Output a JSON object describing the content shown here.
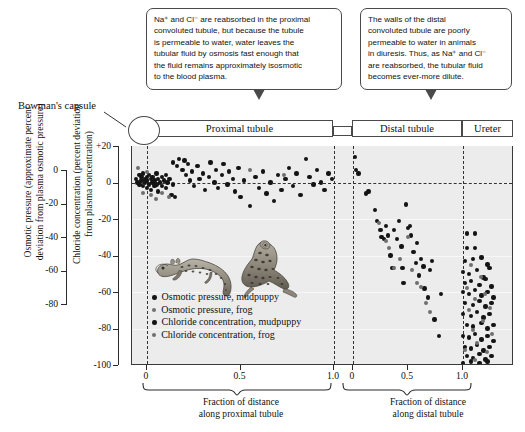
{
  "callouts": {
    "proximal": {
      "name": "proximal-tubule-callout",
      "lines": [
        "Na⁺ and Cl⁻ are reabsorbed in the proximal",
        "convoluted tubule, but because the tubule",
        "is permeable to water, water leaves the",
        "tubular fluid by osmosis fast enough that",
        "the fluid remains approximately isosmotic",
        "to the blood plasma."
      ]
    },
    "distal": {
      "name": "distal-tubule-callout",
      "lines": [
        "The walls of the distal",
        "convoluted tubule are poorly",
        "permeable to water in animals",
        "in diuresis.  Thus, as Na⁺ and Cl⁻",
        "are reabsorbed, the tubular fluid",
        "becomes ever-more dilute."
      ]
    }
  },
  "annotations": {
    "bowman": "Bowman's capsule"
  },
  "segments": {
    "proximal": "Proximal tubule",
    "henle": "",
    "distal": "Distal tubule",
    "ureter": "Ureter"
  },
  "legend": [
    {
      "label": "Osmotic pressure, mudpuppy",
      "marker": "dark"
    },
    {
      "label": "Osmotic pressure, frog",
      "marker": "mid"
    },
    {
      "label": "Chloride concentration, mudpuppy",
      "marker": "dark"
    },
    {
      "label": "Chloride concentration, frog",
      "marker": "mid"
    }
  ],
  "colors": {
    "plot_background": "#ececec",
    "marker_dark": "#141414",
    "marker_mid": "#6f6f6f",
    "axis": "#2b2b2b",
    "box_border": "#4a4a4a"
  },
  "chart_data": {
    "type": "scatter",
    "title": "",
    "ylabel_left": "Osmotic pressure (approximate percent deviation from plasma osmotic pressure)",
    "ylabel_right": "Chloride concentration (percent deviation from plasma concentration)",
    "ylim": [
      -100,
      20
    ],
    "yticks": [
      "+20",
      "0",
      "-20",
      "-40",
      "-60",
      "-80",
      "-100"
    ],
    "ytick_values": [
      20,
      0,
      -20,
      -40,
      -60,
      -80,
      -100
    ],
    "yticks_osmotic": [
      "0",
      "-20",
      "-40",
      "-60",
      "-80"
    ],
    "ytick_values_osmotic": [
      0,
      -20,
      -40,
      -60,
      -80
    ],
    "grid": true,
    "zero_reference_line": 0,
    "panels": [
      {
        "name": "proximal tubule",
        "xlabel": "Fraction of distance along proximal tubule",
        "xticks": [
          "0",
          "0.5",
          "1.0"
        ],
        "xtick_values": [
          0,
          0.5,
          1.0
        ],
        "xlim": [
          0,
          1.0
        ]
      },
      {
        "name": "distal tubule",
        "xlabel": "Fraction of distance along distal tubule",
        "xticks": [
          "0",
          "0.5",
          "1.0"
        ],
        "xtick_values": [
          0,
          0.5,
          1.0
        ],
        "xlim": [
          0,
          1.0
        ]
      },
      {
        "name": "ureter",
        "xlabel": "",
        "xticks": [],
        "xtick_values": [],
        "xlim": [
          1.0,
          1.25
        ]
      }
    ],
    "series": [
      {
        "name": "Osmotic pressure, mudpuppy",
        "marker": "dark",
        "panel": "proximal",
        "points": [
          [
            -0.06,
            2
          ],
          [
            -0.05,
            0
          ],
          [
            -0.04,
            4
          ],
          [
            -0.04,
            -1
          ],
          [
            -0.03,
            3
          ],
          [
            -0.03,
            1
          ],
          [
            -0.02,
            5
          ],
          [
            -0.02,
            -2
          ],
          [
            -0.01,
            2
          ],
          [
            -0.01,
            0
          ],
          [
            0.0,
            3
          ],
          [
            0.0,
            -3
          ],
          [
            0.0,
            1
          ],
          [
            0.01,
            4
          ],
          [
            0.01,
            -1
          ],
          [
            0.02,
            2
          ],
          [
            0.02,
            -4
          ],
          [
            0.03,
            0
          ],
          [
            0.03,
            3
          ],
          [
            0.04,
            -2
          ],
          [
            0.04,
            1
          ],
          [
            0.05,
            5
          ],
          [
            0.05,
            -1
          ],
          [
            0.06,
            2
          ],
          [
            0.06,
            -5
          ],
          [
            0.07,
            0
          ],
          [
            0.08,
            3
          ],
          [
            0.08,
            -2
          ],
          [
            0.09,
            1
          ],
          [
            0.1,
            -3
          ],
          [
            0.1,
            4
          ],
          [
            0.11,
            0
          ],
          [
            0.12,
            2
          ],
          [
            0.13,
            -7
          ],
          [
            0.14,
            -1
          ],
          [
            0.15,
            -8
          ]
        ]
      },
      {
        "name": "Osmotic pressure, frog",
        "marker": "mid",
        "panel": "proximal",
        "points": [
          [
            -0.05,
            8
          ],
          [
            -0.02,
            -6
          ],
          [
            0.0,
            6
          ],
          [
            0.02,
            -7
          ],
          [
            0.05,
            -9
          ],
          [
            0.08,
            -6
          ],
          [
            0.12,
            -8
          ],
          [
            0.55,
            7
          ],
          [
            0.73,
            4
          ]
        ]
      },
      {
        "name": "Chloride concentration, mudpuppy",
        "marker": "dark",
        "panel": "proximal",
        "points": [
          [
            0.14,
            11
          ],
          [
            0.16,
            9
          ],
          [
            0.17,
            13
          ],
          [
            0.19,
            7
          ],
          [
            0.2,
            12
          ],
          [
            0.21,
            4
          ],
          [
            0.22,
            10
          ],
          [
            0.23,
            1
          ],
          [
            0.24,
            6
          ],
          [
            0.25,
            -2
          ],
          [
            0.27,
            9
          ],
          [
            0.28,
            2
          ],
          [
            0.3,
            5
          ],
          [
            0.31,
            -4
          ],
          [
            0.33,
            3
          ],
          [
            0.34,
            11
          ],
          [
            0.36,
            0
          ],
          [
            0.37,
            7
          ],
          [
            0.38,
            -3
          ],
          [
            0.4,
            4
          ],
          [
            0.41,
            10
          ],
          [
            0.43,
            -1
          ],
          [
            0.44,
            6
          ],
          [
            0.46,
            2
          ],
          [
            0.47,
            -5
          ],
          [
            0.49,
            8
          ],
          [
            0.5,
            -8
          ],
          [
            0.52,
            1
          ],
          [
            0.55,
            -13
          ],
          [
            0.58,
            3
          ],
          [
            0.6,
            -3
          ],
          [
            0.62,
            6
          ],
          [
            0.64,
            -6
          ],
          [
            0.66,
            0
          ],
          [
            0.68,
            -10
          ],
          [
            0.7,
            4
          ],
          [
            0.72,
            -4
          ],
          [
            0.74,
            2
          ],
          [
            0.76,
            8
          ],
          [
            0.78,
            -2
          ],
          [
            0.8,
            5
          ],
          [
            0.82,
            -7
          ],
          [
            0.85,
            13
          ],
          [
            0.87,
            3
          ],
          [
            0.89,
            -1
          ],
          [
            0.91,
            7
          ],
          [
            0.93,
            0
          ],
          [
            0.95,
            -4
          ],
          [
            0.97,
            5
          ],
          [
            0.99,
            2
          ]
        ]
      },
      {
        "name": "Chloride concentration, mudpuppy",
        "marker": "dark",
        "panel": "distal",
        "points": [
          [
            0.02,
            14
          ],
          [
            0.03,
            7
          ],
          [
            0.05,
            5
          ],
          [
            0.12,
            -6
          ],
          [
            0.14,
            -5
          ],
          [
            0.2,
            -15
          ],
          [
            0.22,
            -21
          ],
          [
            0.25,
            -26
          ],
          [
            0.26,
            -30
          ],
          [
            0.28,
            -31
          ],
          [
            0.3,
            -24
          ],
          [
            0.32,
            -29
          ],
          [
            0.34,
            -40
          ],
          [
            0.36,
            -47
          ],
          [
            0.37,
            -26
          ],
          [
            0.4,
            -31
          ],
          [
            0.42,
            -21
          ],
          [
            0.44,
            -35
          ],
          [
            0.45,
            -47
          ],
          [
            0.46,
            -55
          ],
          [
            0.48,
            -12
          ],
          [
            0.5,
            -25
          ],
          [
            0.52,
            -24
          ],
          [
            0.53,
            -29
          ],
          [
            0.55,
            -38
          ],
          [
            0.57,
            -44
          ],
          [
            0.58,
            -33
          ],
          [
            0.6,
            -51
          ],
          [
            0.62,
            -42
          ],
          [
            0.64,
            -46
          ],
          [
            0.65,
            -58
          ],
          [
            0.68,
            -63
          ],
          [
            0.7,
            -48
          ],
          [
            0.72,
            -43
          ],
          [
            0.74,
            -75
          ],
          [
            0.78,
            -84
          ],
          [
            0.8,
            -61
          ]
        ]
      },
      {
        "name": "Chloride concentration, frog",
        "marker": "mid",
        "panel": "distal",
        "points": [
          [
            0.24,
            -22
          ],
          [
            0.3,
            -32
          ],
          [
            0.33,
            -36
          ],
          [
            0.37,
            -47
          ],
          [
            0.43,
            -42
          ],
          [
            0.5,
            -30
          ],
          [
            0.54,
            -48
          ],
          [
            0.58,
            -55
          ],
          [
            0.62,
            -57
          ],
          [
            0.66,
            -66
          ],
          [
            0.7,
            -71
          ]
        ]
      },
      {
        "name": "Chloride concentration, mudpuppy",
        "marker": "dark",
        "panel": "ureter",
        "points": [
          [
            1.02,
            -28
          ],
          [
            1.06,
            -28
          ],
          [
            1.02,
            -36
          ],
          [
            1.06,
            -36
          ],
          [
            1.01,
            -43
          ],
          [
            1.05,
            -42
          ],
          [
            1.09,
            -41
          ],
          [
            1.12,
            -45
          ],
          [
            1.0,
            -49
          ],
          [
            1.03,
            -50
          ],
          [
            1.07,
            -48
          ],
          [
            1.1,
            -52
          ],
          [
            1.13,
            -47
          ],
          [
            1.01,
            -55
          ],
          [
            1.04,
            -54
          ],
          [
            1.08,
            -56
          ],
          [
            1.11,
            -53
          ],
          [
            1.14,
            -57
          ],
          [
            1.0,
            -60
          ],
          [
            1.03,
            -61
          ],
          [
            1.06,
            -59
          ],
          [
            1.09,
            -62
          ],
          [
            1.12,
            -60
          ],
          [
            1.15,
            -63
          ],
          [
            1.01,
            -66
          ],
          [
            1.05,
            -67
          ],
          [
            1.08,
            -65
          ],
          [
            1.11,
            -68
          ],
          [
            1.14,
            -66
          ],
          [
            1.0,
            -72
          ],
          [
            1.04,
            -73
          ],
          [
            1.07,
            -71
          ],
          [
            1.1,
            -74
          ],
          [
            1.13,
            -72
          ],
          [
            1.02,
            -78
          ],
          [
            1.05,
            -79
          ],
          [
            1.09,
            -77
          ],
          [
            1.12,
            -80
          ],
          [
            1.15,
            -78
          ],
          [
            1.0,
            -84
          ],
          [
            1.03,
            -85
          ],
          [
            1.06,
            -83
          ],
          [
            1.09,
            -86
          ],
          [
            1.12,
            -84
          ],
          [
            1.15,
            -87
          ],
          [
            1.01,
            -90
          ],
          [
            1.04,
            -91
          ],
          [
            1.07,
            -89
          ],
          [
            1.1,
            -92
          ],
          [
            1.13,
            -90
          ],
          [
            1.02,
            -95
          ],
          [
            1.05,
            -96
          ],
          [
            1.08,
            -94
          ],
          [
            1.11,
            -97
          ],
          [
            1.14,
            -95
          ],
          [
            1.0,
            -99
          ],
          [
            1.04,
            -98
          ],
          [
            1.08,
            -99
          ],
          [
            1.12,
            -98
          ]
        ]
      },
      {
        "name": "Chloride concentration, frog",
        "marker": "mid",
        "panel": "ureter",
        "points": [
          [
            1.04,
            -45
          ],
          [
            1.09,
            -52
          ],
          [
            1.02,
            -58
          ],
          [
            1.11,
            -61
          ],
          [
            1.06,
            -64
          ],
          [
            1.13,
            -69
          ],
          [
            1.03,
            -70
          ],
          [
            1.1,
            -76
          ],
          [
            1.05,
            -81
          ],
          [
            1.14,
            -83
          ],
          [
            1.07,
            -88
          ],
          [
            1.01,
            -92
          ],
          [
            1.12,
            -93
          ],
          [
            1.06,
            -97
          ]
        ]
      }
    ]
  }
}
